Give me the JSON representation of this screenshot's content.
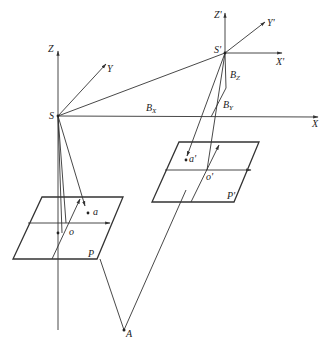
{
  "diagram": {
    "type": "stereo photogrammetry geometry",
    "colors": {
      "line": "#333333",
      "background": "#ffffff"
    },
    "left_station": {
      "center": "S",
      "axes": {
        "z": "Z",
        "y": "Y",
        "x": "X"
      },
      "image_plane": "P",
      "principal_point": "o",
      "image_point": "a"
    },
    "right_station": {
      "center": "S'",
      "axes": {
        "z": "Z'",
        "y": "Y'",
        "x": "X'"
      },
      "image_plane": "P'",
      "principal_point": "o'",
      "image_point": "a'"
    },
    "baseline": {
      "bx": "B",
      "bx_sub": "X",
      "by": "B",
      "by_sub": "Y",
      "bz": "B",
      "bz_sub": "Z"
    },
    "ground_point": "A"
  }
}
